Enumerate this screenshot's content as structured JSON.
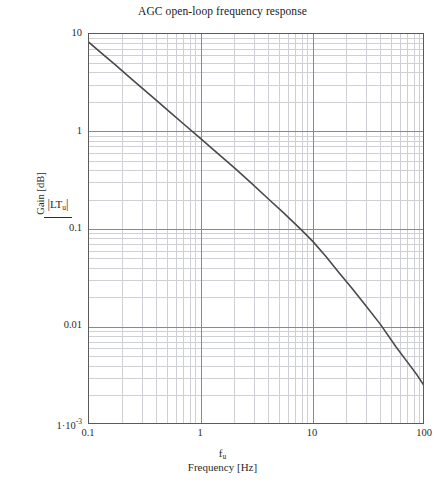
{
  "chart_data": {
    "type": "line",
    "title": "AGC open-loop frequency response",
    "xlabel": "Frequency [Hz]",
    "xlabel_var": "f",
    "xlabel_var_sub": "u",
    "ylabel": "Gain [dB]",
    "ylabel_var": "LT",
    "ylabel_var_sub": "u",
    "xscale": "log",
    "yscale": "log",
    "xlim": [
      0.1,
      100
    ],
    "ylim": [
      0.001,
      10
    ],
    "grid": true,
    "minor_grid": true,
    "legend": "none",
    "xticks": [
      {
        "value": 0.1,
        "label": "0.1"
      },
      {
        "value": 1,
        "label": "1"
      },
      {
        "value": 10,
        "label": "10"
      },
      {
        "value": 100,
        "label": "100"
      }
    ],
    "yticks": [
      {
        "value": 10,
        "label": "10",
        "sup": ""
      },
      {
        "value": 1,
        "label": "1",
        "sup": ""
      },
      {
        "value": 0.1,
        "label": "0.1",
        "sup": ""
      },
      {
        "value": 0.01,
        "label": "0.01",
        "sup": ""
      },
      {
        "value": 0.001,
        "label": "1·10",
        "sup": "-3"
      }
    ],
    "series": [
      {
        "name": "|LT_u|",
        "color": "#4a4a4a",
        "x": [
          0.1,
          0.13,
          0.17,
          0.22,
          0.3,
          0.4,
          0.55,
          0.7,
          1.0,
          1.4,
          2.0,
          2.8,
          4.0,
          5.5,
          7.0,
          8.0,
          10.0,
          13.0,
          17.0,
          22.0,
          30.0,
          40.0,
          55.0,
          70.0,
          85.0,
          100.0
        ],
        "y": [
          8.2,
          6.35,
          4.88,
          3.78,
          2.78,
          2.09,
          1.52,
          1.2,
          0.845,
          0.605,
          0.424,
          0.3,
          0.205,
          0.147,
          0.113,
          0.0975,
          0.0752,
          0.0533,
          0.0363,
          0.0255,
          0.0163,
          0.0107,
          0.00631,
          0.00437,
          0.00324,
          0.00245
        ]
      }
    ]
  },
  "colors": {
    "curve": "#4a4a4a",
    "major_grid": "#8a8a8a",
    "minor_grid": "#cfcfd6",
    "axis_frame": "#5a5a5a",
    "text": "#1a1a1a",
    "background": "#ffffff"
  }
}
